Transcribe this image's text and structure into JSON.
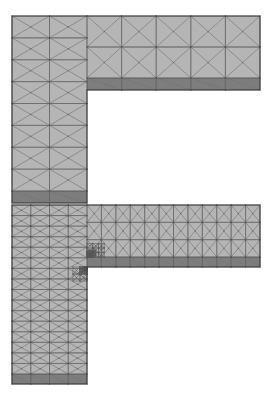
{
  "figure": {
    "background_color": "#ffffff",
    "width": 270,
    "height": 393,
    "panel_count": 2,
    "panels": [
      {
        "name": "coarse-mesh",
        "label": "Coarse initial triangular mesh",
        "origin_x": 12,
        "origin_y": 16,
        "vertical_arm_width": 75,
        "vertical_arm_height": 175,
        "horizontal_arm_length": 248,
        "horizontal_arm_height": 62,
        "dark_band_thickness": 12,
        "cols_vertical": 2,
        "rows_vertical": 8,
        "cols_horizontal": 5,
        "rows_horizontal": 2,
        "dark_band_cols": 5,
        "refined_corner": false,
        "corner_levels": 0
      },
      {
        "name": "refined-mesh",
        "label": "Adaptively refined triangular mesh with corner refinement",
        "origin_x": 12,
        "origin_y": 205,
        "vertical_arm_width": 75,
        "vertical_arm_height": 169,
        "horizontal_arm_length": 248,
        "horizontal_arm_height": 52,
        "dark_band_thickness": 10,
        "cols_vertical": 4,
        "rows_vertical": 16,
        "cols_horizontal": 12,
        "rows_horizontal": 3,
        "dark_band_cols": 12,
        "refined_corner": true,
        "corner_levels": 4
      }
    ],
    "colors": {
      "element_fill": "#b5b5b5",
      "element_fill_dark": "#7d7d7d",
      "edge_stroke": "#5a5a5a",
      "outline_stroke": "#3c3c3c",
      "background": "#ffffff"
    },
    "stroke_widths": {
      "edge": 0.55,
      "outline": 1.1,
      "dark_edge": 0.5
    },
    "geometry_notes": {
      "shape": "Gamma-shape / inverted-L",
      "reentrant_corner": "top-left interior corner between vertical and horizontal arms",
      "element_type": "triangle",
      "pattern": "crossed-diagonal quadrilaterals split into four triangles"
    }
  }
}
